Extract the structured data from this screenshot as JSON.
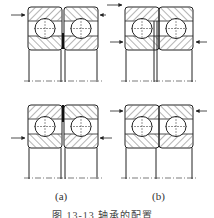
{
  "figure": {
    "labels": {
      "a": "(a)",
      "b": "(b)"
    },
    "caption": "图 13-13  轴承的配置",
    "colors": {
      "line": "#222222",
      "hatch": "#444444",
      "background": "#ffffff"
    },
    "panels": [
      {
        "id": "a",
        "description": "Paired angular contact ball bearings, face arrangement with spacer (top: back-to-back, bottom: face-to-face)"
      },
      {
        "id": "b",
        "description": "Paired angular contact ball bearings, tandem/other arrangement with axial load arrows"
      }
    ]
  }
}
